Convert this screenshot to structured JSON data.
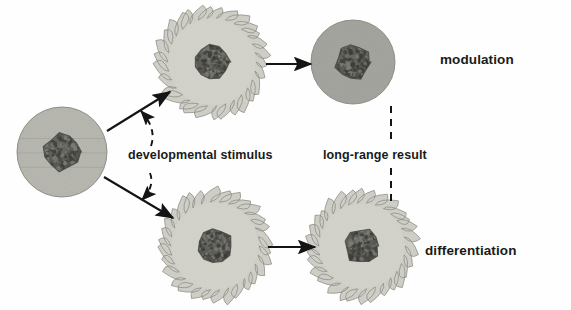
{
  "diagram": {
    "background_color": "#fefefe",
    "palette": {
      "cell_body_light": "#cfcfc7",
      "cell_body_dark": "#a9a9a4",
      "cell_outline": "#8a8a84",
      "nucleus": "#595954",
      "nucleus_dark": "#45454050",
      "arrow": "#141414",
      "text": "#1a1a1a"
    },
    "cells": [
      {
        "id": "progenitor-cell",
        "name": "progenitor-cell",
        "shape": "smooth-circle",
        "fill": "#b9b9b2",
        "cx": 62,
        "cy": 152,
        "r": 45,
        "nucleus_r": 18,
        "spikes": 0
      },
      {
        "id": "stimulated-cell-top",
        "name": "stimulated-cell-top",
        "shape": "spiky-circle",
        "fill": "#d2d2ca",
        "cx": 212,
        "cy": 62,
        "r": 44,
        "nucleus_r": 17,
        "spikes": 30
      },
      {
        "id": "modulated-cell",
        "name": "modulated-cell",
        "shape": "smooth-circle",
        "fill": "#a6a6a0",
        "cx": 353,
        "cy": 62,
        "r": 42,
        "nucleus_r": 17,
        "spikes": 0
      },
      {
        "id": "stimulated-cell-bottom",
        "name": "stimulated-cell-bottom",
        "shape": "spiky-circle",
        "fill": "#d2d2ca",
        "cx": 215,
        "cy": 246,
        "r": 44,
        "nucleus_r": 17,
        "spikes": 30
      },
      {
        "id": "differentiated-cell",
        "name": "differentiated-cell",
        "shape": "spiky-circle",
        "fill": "#d2d2ca",
        "cx": 362,
        "cy": 246,
        "r": 43,
        "nucleus_r": 17,
        "spikes": 30
      }
    ],
    "arrows": [
      {
        "id": "arrow-progenitor-to-top",
        "name": "arrow-progenitor-to-top",
        "style": "solid",
        "x1": 107,
        "y1": 131,
        "x2": 170,
        "y2": 92
      },
      {
        "id": "arrow-progenitor-to-bottom",
        "name": "arrow-progenitor-to-bottom",
        "style": "solid",
        "x1": 104,
        "y1": 177,
        "x2": 173,
        "y2": 218
      },
      {
        "id": "arrow-top-to-modulated",
        "name": "arrow-top-to-modulated",
        "style": "solid",
        "x1": 266,
        "y1": 64,
        "x2": 311,
        "y2": 64
      },
      {
        "id": "arrow-bottom-to-differentiated",
        "name": "arrow-bottom-to-differentiated",
        "style": "solid",
        "x1": 268,
        "y1": 247,
        "x2": 315,
        "y2": 247
      },
      {
        "id": "dashed-stimulus-upper",
        "name": "dashed-stimulus-upper-branch",
        "style": "dashed",
        "x1": 151,
        "y1": 146,
        "x2": 141,
        "y2": 111
      },
      {
        "id": "dashed-stimulus-lower",
        "name": "dashed-stimulus-lower-branch",
        "style": "dashed",
        "x1": 150,
        "y1": 173,
        "x2": 142,
        "y2": 200
      },
      {
        "id": "dashed-long-range-upper",
        "name": "dashed-long-range-upper-segment",
        "style": "dashed",
        "x1": 391,
        "y1": 106,
        "x2": 391,
        "y2": 143
      },
      {
        "id": "dashed-long-range-lower",
        "name": "dashed-long-range-lower-segment",
        "style": "dashed",
        "x1": 391,
        "y1": 168,
        "x2": 391,
        "y2": 206
      }
    ],
    "labels": {
      "developmental_stimulus": "developmental stimulus",
      "long_range_result": "long-range result",
      "modulation": "modulation",
      "differentiation": "differentiation"
    }
  }
}
